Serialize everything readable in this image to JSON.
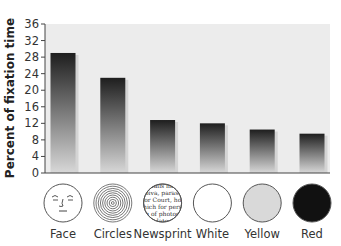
{
  "chart_data": {
    "type": "bar",
    "title": "",
    "xlabel": "",
    "ylabel": "Percent of fixation time",
    "ylim": [
      0,
      36
    ],
    "yticks": [
      0,
      4,
      8,
      12,
      16,
      20,
      24,
      28,
      32,
      36
    ],
    "categories": [
      "Face",
      "Circles",
      "Newsprint",
      "White",
      "Yellow",
      "Red"
    ],
    "values": [
      29,
      23,
      12.8,
      12,
      10.5,
      9.5
    ],
    "grid": false,
    "legend": "none",
    "stimulus_icons": [
      {
        "category": "Face",
        "icon": "face-drawing-icon",
        "fill": "#ffffff"
      },
      {
        "category": "Circles",
        "icon": "concentric-circles-icon",
        "fill": "#ffffff"
      },
      {
        "category": "Newsprint",
        "icon": "newsprint-circle-icon",
        "fill": "#ffffff"
      },
      {
        "category": "White",
        "icon": "white-disc-icon",
        "fill": "#ffffff"
      },
      {
        "category": "Yellow",
        "icon": "yellow-disc-icon",
        "fill": "#d9d9d9"
      },
      {
        "category": "Red",
        "icon": "red-disc-icon",
        "fill": "#111111"
      }
    ],
    "newsprint_lines": [
      "ualis ille",
      "oiva, parasi",
      "for Court, hol",
      "vhich for perso",
      "n of photog",
      "lato"
    ]
  },
  "colors": {
    "plot_background": "#ececec",
    "bar_top": "#1e1e1e",
    "bar_bottom": "#d8d8d8",
    "axis": "#444444"
  }
}
